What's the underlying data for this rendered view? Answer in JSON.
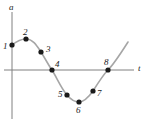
{
  "figure": {
    "width": 151,
    "height": 126,
    "background_color": "#ffffff",
    "curve_color": "#a6a6a6",
    "axis_color": "#808080",
    "point_color": "#1a1a1a"
  },
  "axes": {
    "vertical": {
      "label": "a",
      "label_x": 9,
      "label_y": 3,
      "x": 12,
      "y_top": 12,
      "y_bottom": 119
    },
    "horizontal": {
      "label": "t",
      "label_x": 138,
      "label_y": 64,
      "y": 70,
      "x_left": 4,
      "x_right": 134
    }
  },
  "curve": {
    "path": "M 12,45 C 17,41 21,39 26,39 C 33,39 37,46 41,52 C 46,60 49,66 52,70 C 57,78 61,88 67,95 C 72,101 75,102 79,102 C 84,102 88,98 93,91 C 98,83 103,75 108,70 C 114,64 121,53 128,42"
  },
  "points": [
    {
      "label": "1",
      "cx": 12,
      "cy": 45,
      "r": 2.6,
      "label_x": 3,
      "label_y": 42
    },
    {
      "label": "2",
      "cx": 26,
      "cy": 39,
      "r": 2.6,
      "label_x": 23,
      "label_y": 28
    },
    {
      "label": "3",
      "cx": 41,
      "cy": 52,
      "r": 2.6,
      "label_x": 46,
      "label_y": 45
    },
    {
      "label": "4",
      "cx": 52,
      "cy": 70,
      "r": 2.6,
      "label_x": 55,
      "label_y": 60
    },
    {
      "label": "5",
      "cx": 67,
      "cy": 95,
      "r": 2.6,
      "label_x": 58,
      "label_y": 90
    },
    {
      "label": "6",
      "cx": 79,
      "cy": 102,
      "r": 2.6,
      "label_x": 76,
      "label_y": 106
    },
    {
      "label": "7",
      "cx": 93,
      "cy": 91,
      "r": 2.6,
      "label_x": 97,
      "label_y": 89
    },
    {
      "label": "8",
      "cx": 108,
      "cy": 70,
      "r": 2.6,
      "label_x": 104,
      "label_y": 58
    }
  ]
}
